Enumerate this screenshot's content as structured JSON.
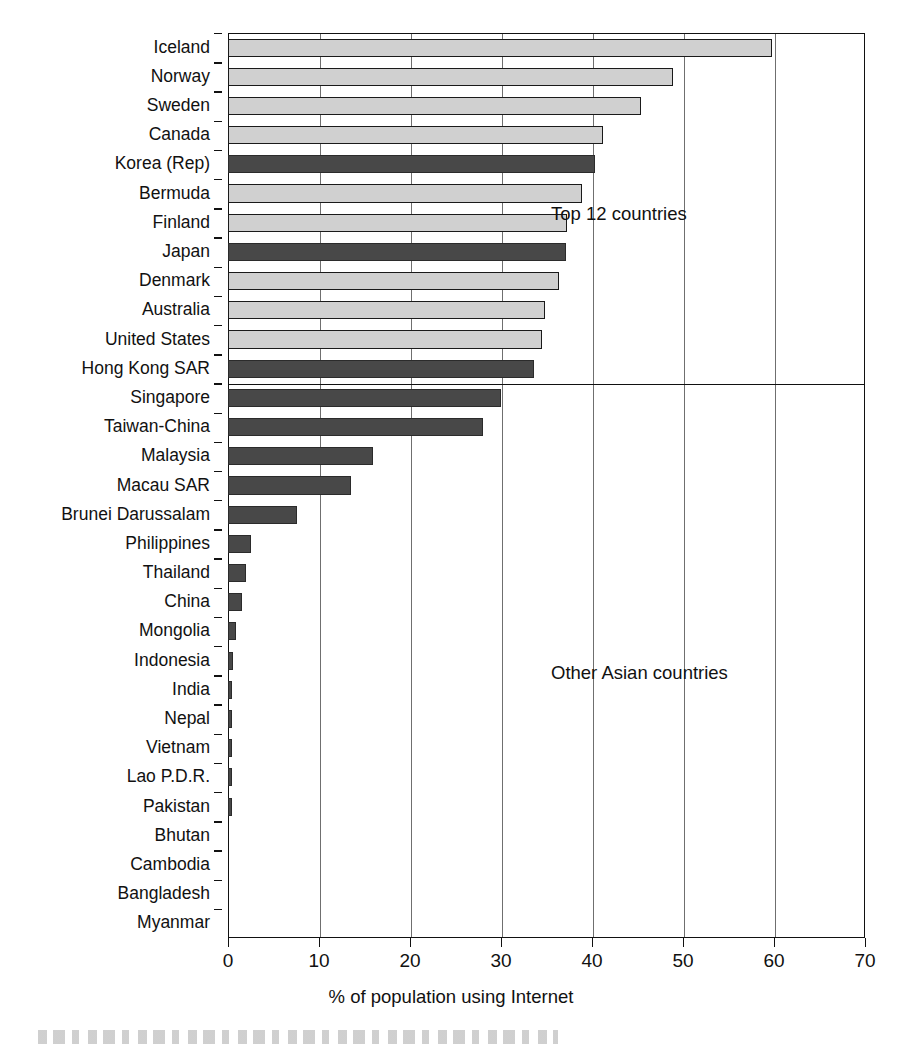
{
  "chart_data": {
    "type": "bar",
    "orientation": "horizontal",
    "title": "",
    "xlabel": "% of population using Internet",
    "ylabel": "",
    "xlim": [
      0,
      70
    ],
    "xticks": [
      0,
      10,
      20,
      30,
      40,
      50,
      60,
      70
    ],
    "grid": true,
    "grid_axis": "x",
    "legend": null,
    "annotations": [
      {
        "text": "Top 12 countries",
        "x": 41,
        "y_index": 6
      },
      {
        "text": "Other Asian countries",
        "x": 41,
        "y_index": 21
      }
    ],
    "series": [
      {
        "name": "Top 12 countries",
        "color": "#d0d0d0"
      },
      {
        "name": "Other Asian countries",
        "color": "#484848"
      }
    ],
    "categories": [
      "Iceland",
      "Norway",
      "Sweden",
      "Canada",
      "Korea (Rep)",
      "Bermuda",
      "Finland",
      "Japan",
      "Denmark",
      "Australia",
      "United States",
      "Hong Kong SAR",
      "Singapore",
      "Taiwan-China",
      "Malaysia",
      "Macau SAR",
      "Brunei Darussalam",
      "Philippines",
      "Thailand",
      "China",
      "Mongolia",
      "Indonesia",
      "India",
      "Nepal",
      "Vietnam",
      "Lao P.D.R.",
      "Pakistan",
      "Bhutan",
      "Cambodia",
      "Bangladesh",
      "Myanmar"
    ],
    "values": [
      59.8,
      48.9,
      45.4,
      41.2,
      40.3,
      38.9,
      37.2,
      37.1,
      36.4,
      34.8,
      34.5,
      33.6,
      30.0,
      28.0,
      15.9,
      13.5,
      7.6,
      2.5,
      2.0,
      1.5,
      0.9,
      0.5,
      0.4,
      0.35,
      0.35,
      0.35,
      0.35,
      0.0,
      0.0,
      0.0,
      0.0
    ],
    "group": [
      "top12",
      "top12",
      "top12",
      "top12",
      "asia",
      "top12",
      "top12",
      "asia",
      "top12",
      "top12",
      "top12",
      "asia",
      "asia",
      "asia",
      "asia",
      "asia",
      "asia",
      "asia",
      "asia",
      "asia",
      "asia",
      "asia",
      "asia",
      "asia",
      "asia",
      "asia",
      "asia",
      "asia",
      "asia",
      "asia",
      "asia"
    ],
    "group_divider_after_index": 11
  },
  "axis": {
    "x_tick_labels": [
      "0",
      "10",
      "20",
      "30",
      "40",
      "50",
      "60",
      "70"
    ],
    "x_title": "% of population using Internet"
  },
  "annotations": {
    "top12": "Top 12 countries",
    "other": "Other Asian countries"
  },
  "colors": {
    "top12_fill": "#d0d0d0",
    "asia_fill": "#484848",
    "axis": "#111111",
    "grid": "#6f6f6f",
    "background": "#ffffff"
  }
}
